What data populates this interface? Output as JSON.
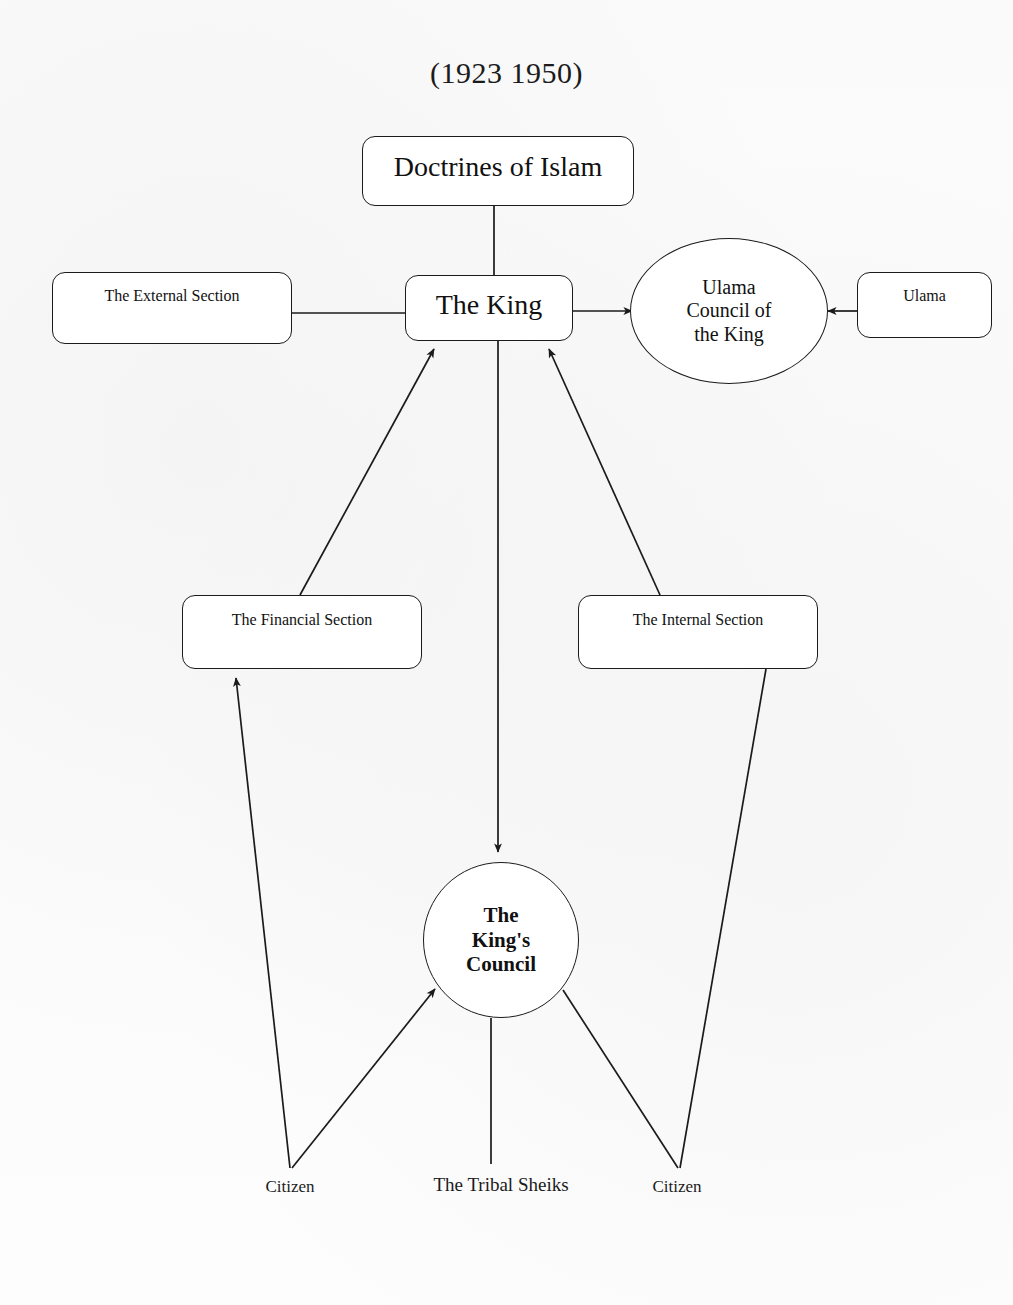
{
  "diagram": {
    "title": "(1923    1950)",
    "nodes": {
      "doctrines": {
        "label": "Doctrines of Islam",
        "shape": "rounded-box"
      },
      "king": {
        "label": "The King",
        "shape": "rounded-box"
      },
      "external_section": {
        "label": "The External Section",
        "shape": "rounded-box"
      },
      "ulama": {
        "label": "Ulama",
        "shape": "rounded-box"
      },
      "ulama_council": {
        "label": "Ulama\nCouncil of\nthe King",
        "shape": "ellipse"
      },
      "financial_section": {
        "label": "The Financial Section",
        "shape": "rounded-box"
      },
      "internal_section": {
        "label": "The Internal Section",
        "shape": "rounded-box"
      },
      "kings_council": {
        "label": "The\nKing's\nCouncil",
        "shape": "circle"
      }
    },
    "labels": {
      "citizen_left": "Citizen",
      "tribal_sheiks": "The Tribal Sheiks",
      "citizen_right": "Citizen"
    },
    "colors": {
      "stroke": "#1b1b1b",
      "background": "#fefefe",
      "text": "#111111"
    },
    "edges": [
      {
        "from": "doctrines",
        "to": "king",
        "arrow": "none"
      },
      {
        "from": "external_section",
        "to": "king",
        "arrow": "none"
      },
      {
        "from": "king",
        "to": "ulama_council",
        "arrow": "to"
      },
      {
        "from": "ulama",
        "to": "ulama_council",
        "arrow": "to"
      },
      {
        "from": "financial_section",
        "to": "king",
        "arrow": "to"
      },
      {
        "from": "internal_section",
        "to": "king",
        "arrow": "to"
      },
      {
        "from": "king",
        "to": "kings_council",
        "arrow": "to"
      },
      {
        "from": "citizen_left",
        "to": "financial_section",
        "arrow": "to"
      },
      {
        "from": "citizen_left",
        "to": "kings_council",
        "arrow": "to"
      },
      {
        "from": "tribal_sheiks",
        "to": "kings_council",
        "arrow": "none"
      },
      {
        "from": "citizen_right",
        "to": "internal_section",
        "arrow": "none"
      },
      {
        "from": "citizen_right",
        "to": "kings_council",
        "arrow": "none"
      }
    ]
  }
}
